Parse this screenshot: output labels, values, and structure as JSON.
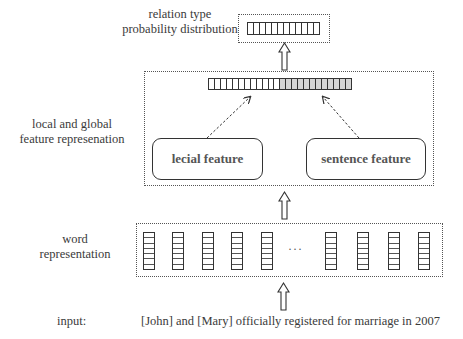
{
  "labels": {
    "output_line1": "relation type",
    "output_line2": "probability distribution",
    "feature_line1": "local and global",
    "feature_line2": "feature represenation",
    "word_line1": "word",
    "word_line2": "representation",
    "input_label": "input:",
    "input_sentence": "[John] and [Mary] officially registered for marriage in 2007"
  },
  "boxes": {
    "lexical_feature": "lecial feature",
    "sentence_feature": "sentence feature",
    "ellipsis": "···"
  },
  "structure": {
    "output_vector_cells": 12,
    "feature_vector_white_cells": 12,
    "feature_vector_grey_cells": 12,
    "word_columns_left": 5,
    "word_columns_right": 4,
    "cells_per_word_column": 7
  },
  "colors": {
    "line": "#333333",
    "grey_cell": "#d6d6d6",
    "text": "#3a3a3a"
  }
}
